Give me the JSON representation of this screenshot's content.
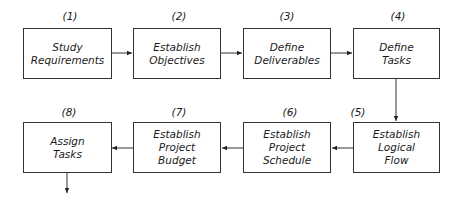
{
  "steps": [
    {
      "num": "(1)",
      "line1": "Study",
      "line2": "Requirements",
      "line3": ""
    },
    {
      "num": "(2)",
      "line1": "Establish",
      "line2": "Objectives",
      "line3": ""
    },
    {
      "num": "(3)",
      "line1": "Define",
      "line2": "Deliverables",
      "line3": ""
    },
    {
      "num": "(4)",
      "line1": "Define",
      "line2": "Tasks",
      "line3": ""
    },
    {
      "num": "(5)",
      "line1": "Establish",
      "line2": "Logical",
      "line3": "Flow"
    },
    {
      "num": "(6)",
      "line1": "Establish",
      "line2": "Project",
      "line3": "Schedule"
    },
    {
      "num": "(7)",
      "line1": "Establish",
      "line2": "Project",
      "line3": "Budget"
    },
    {
      "num": "(8)",
      "line1": "Assign",
      "line2": "Tasks",
      "line3": ""
    }
  ]
}
